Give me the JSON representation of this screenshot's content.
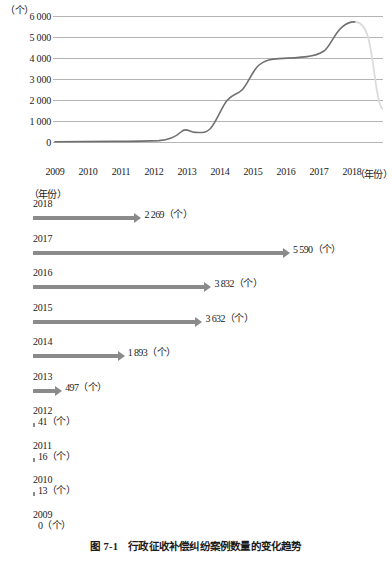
{
  "figure": {
    "caption_number": "图 7-1",
    "caption_title": "行政征收补偿纠纷案例数量的变化趋势"
  },
  "line_chart": {
    "y_axis_unit": "（个）",
    "x_axis_unit": "（年份）",
    "y_ticks": [
      "6 000",
      "5 000",
      "4 000",
      "3 000",
      "2 000",
      "1 000",
      "0"
    ],
    "x_ticks": [
      "2009",
      "2010",
      "2011",
      "2012",
      "2013",
      "2014",
      "2015",
      "2016",
      "2017",
      "2018"
    ],
    "line_color": "#707070",
    "faded_line_color": "#dcdcdc",
    "grid_color": "#b4b4b4"
  },
  "bar_chart": {
    "unit_label": "（年份）",
    "unit_suffix": "（个）",
    "bar_color": "#8a8a8a",
    "rows": [
      {
        "year": "2018",
        "value": 2269,
        "value_label": "2 269",
        "unit": "（个）"
      },
      {
        "year": "2017",
        "value": 5590,
        "value_label": "5 590",
        "unit": "（个）"
      },
      {
        "year": "2016",
        "value": 3832,
        "value_label": "3 832",
        "unit": "（个）"
      },
      {
        "year": "2015",
        "value": 3632,
        "value_label": "3 632",
        "unit": "（个）"
      },
      {
        "year": "2014",
        "value": 1893,
        "value_label": "1 893",
        "unit": "（个）"
      },
      {
        "year": "2013",
        "value": 497,
        "value_label": "497",
        "unit": "（个）"
      },
      {
        "year": "2012",
        "value": 41,
        "value_label": "41",
        "unit": "（个）"
      },
      {
        "year": "2011",
        "value": 16,
        "value_label": "16",
        "unit": "（个）"
      },
      {
        "year": "2010",
        "value": 13,
        "value_label": "13",
        "unit": "（个）"
      },
      {
        "year": "2009",
        "value": 0,
        "value_label": "0",
        "unit": "（个）"
      }
    ]
  },
  "chart_data": [
    {
      "type": "line",
      "title": "行政征收补偿纠纷案例数量的变化趋势",
      "xlabel": "（年份）",
      "ylabel": "（个）",
      "x": [
        2009,
        2010,
        2011,
        2012,
        2013,
        2014,
        2015,
        2016,
        2017,
        2018
      ],
      "values": [
        0,
        13,
        16,
        41,
        497,
        1893,
        3632,
        3832,
        5590,
        2269
      ],
      "xlim": [
        2009,
        2018
      ],
      "ylim": [
        0,
        6000
      ],
      "yticks": [
        0,
        1000,
        2000,
        3000,
        4000,
        5000,
        6000
      ],
      "grid": "horizontal",
      "legend": "none",
      "note": "Smoothed curve; segment descending from 2017 peak to 2018 is rendered in faint gray"
    },
    {
      "type": "bar",
      "orientation": "horizontal",
      "title": "行政征收补偿纠纷案例数量（按年份）",
      "xlabel": "（个）",
      "ylabel": "（年份）",
      "categories": [
        "2018",
        "2017",
        "2016",
        "2015",
        "2014",
        "2013",
        "2012",
        "2011",
        "2010",
        "2009"
      ],
      "values": [
        2269,
        5590,
        3832,
        3632,
        1893,
        497,
        41,
        16,
        13,
        0
      ],
      "xlim": [
        0,
        5590
      ],
      "grid": "off",
      "legend": "none"
    }
  ]
}
